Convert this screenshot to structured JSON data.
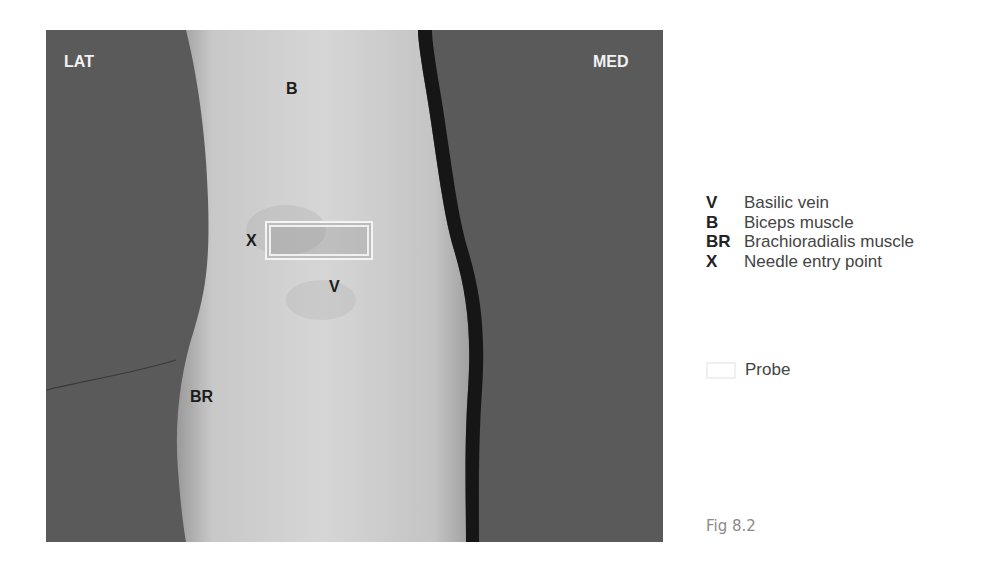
{
  "figure": {
    "caption": "Fig 8.2",
    "photo_labels": {
      "lateral": "LAT",
      "medial": "MED",
      "biceps": "B",
      "needle_entry": "X",
      "vein": "V",
      "brachioradialis": "BR"
    },
    "legend": [
      {
        "key": "V",
        "text": "Basilic vein"
      },
      {
        "key": "B",
        "text": "Biceps muscle"
      },
      {
        "key": "BR",
        "text": "Brachioradialis muscle"
      },
      {
        "key": "X",
        "text": "Needle entry point"
      }
    ],
    "probe_legend": "Probe"
  }
}
